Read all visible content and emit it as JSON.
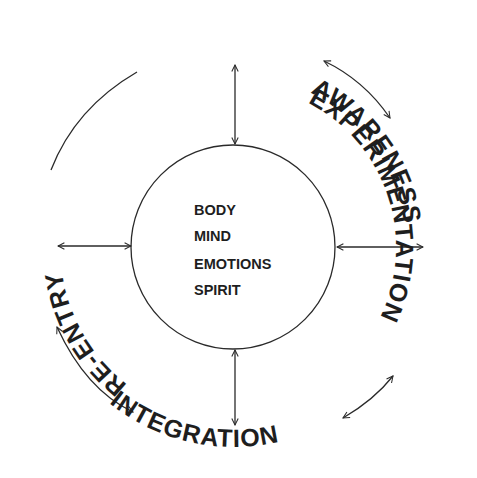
{
  "diagram": {
    "stages": [
      {
        "id": "awareness",
        "label": "AWARENESS"
      },
      {
        "id": "experimentation",
        "label": "EXPERIMENTATION"
      },
      {
        "id": "integration",
        "label": "INTEGRATION"
      },
      {
        "id": "re-entry",
        "label": "RE-ENTRY"
      }
    ],
    "core": {
      "items": [
        "BODY",
        "MIND",
        "EMOTIONS",
        "SPIRIT"
      ]
    },
    "connections": [
      {
        "from": "awareness",
        "to": "experimentation",
        "type": "bidirectional"
      },
      {
        "from": "experimentation",
        "to": "integration",
        "type": "bidirectional"
      },
      {
        "from": "integration",
        "to": "re-entry",
        "type": "bidirectional"
      },
      {
        "from": "re-entry",
        "to": "awareness",
        "type": "line"
      },
      {
        "from": "core",
        "to": "awareness",
        "type": "bidirectional"
      },
      {
        "from": "core",
        "to": "experimentation",
        "type": "bidirectional"
      },
      {
        "from": "core",
        "to": "integration",
        "type": "bidirectional"
      },
      {
        "from": "core",
        "to": "re-entry",
        "type": "bidirectional"
      }
    ],
    "colors": {
      "ink": "#1e1e1e",
      "background": "#ffffff"
    }
  }
}
